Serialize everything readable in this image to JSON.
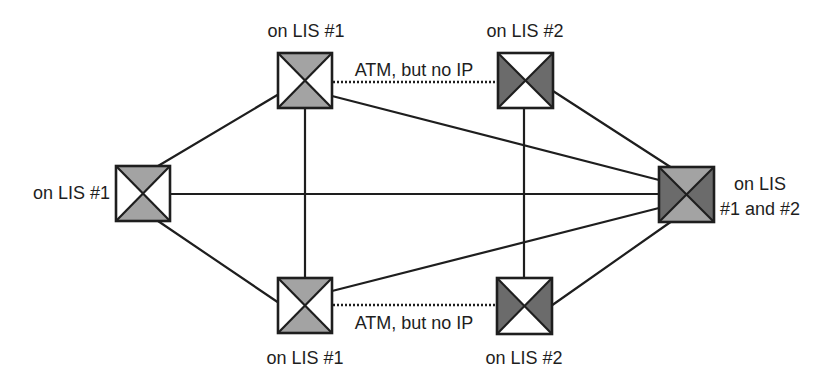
{
  "diagram": {
    "colors": {
      "line": "#1e1e1e",
      "light_fill": "#a3a3a3",
      "dark_fill": "#6b6b6b",
      "white_fill": "#ffffff",
      "background": "#ffffff"
    },
    "switches": [
      {
        "id": "left",
        "label": "on LIS #1",
        "membership": "LIS #1",
        "top_bottom": "light",
        "left_right": "white"
      },
      {
        "id": "top-left",
        "label": "on LIS #1",
        "membership": "LIS #1",
        "top_bottom": "light",
        "left_right": "white"
      },
      {
        "id": "top-right",
        "label": "on LIS #2",
        "membership": "LIS #2",
        "top_bottom": "white",
        "left_right": "dark"
      },
      {
        "id": "bottom-left",
        "label": "on LIS #1",
        "membership": "LIS #1",
        "top_bottom": "light",
        "left_right": "white"
      },
      {
        "id": "bottom-right",
        "label": "on LIS #2",
        "membership": "LIS #2",
        "top_bottom": "white",
        "left_right": "dark"
      },
      {
        "id": "right",
        "label_line1": "on LIS",
        "label_line2": "#1 and #2",
        "membership": "LIS #1 and #2",
        "top_bottom": "light",
        "left_right": "dark"
      }
    ],
    "links": [
      {
        "from": "left",
        "to": "top-left",
        "style": "solid"
      },
      {
        "from": "left",
        "to": "bottom-left",
        "style": "solid"
      },
      {
        "from": "left",
        "to": "right",
        "style": "solid"
      },
      {
        "from": "top-left",
        "to": "bottom-left",
        "style": "solid"
      },
      {
        "from": "top-left",
        "to": "right",
        "style": "solid"
      },
      {
        "from": "bottom-left",
        "to": "right",
        "style": "solid"
      },
      {
        "from": "top-right",
        "to": "bottom-right",
        "style": "solid"
      },
      {
        "from": "top-right",
        "to": "right",
        "style": "solid"
      },
      {
        "from": "bottom-right",
        "to": "right",
        "style": "solid"
      },
      {
        "from": "top-left",
        "to": "top-right",
        "style": "dotted",
        "label": "ATM, but no IP"
      },
      {
        "from": "bottom-left",
        "to": "bottom-right",
        "style": "dotted",
        "label": "ATM, but no IP"
      }
    ],
    "dotted_link_labels": {
      "top": "ATM, but no IP",
      "bottom": "ATM, but no IP"
    }
  }
}
